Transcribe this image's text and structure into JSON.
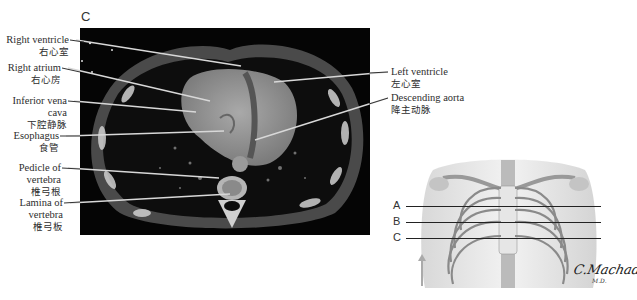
{
  "figure": {
    "panel_letter": "C",
    "ct_labels_left": [
      {
        "en": "Right ventricle",
        "zh": "右心室"
      },
      {
        "en": "Right atrium",
        "zh": "右心房"
      },
      {
        "en": "Inferior vena cava",
        "en_line1": "Inferior vena",
        "en_line2": "cava",
        "zh": "下腔静脉"
      },
      {
        "en": "Esophagus",
        "zh": "食管"
      },
      {
        "en": "Pedicle of vertebra",
        "en_line1": "Pedicle of",
        "en_line2": "vertebra",
        "zh": "椎弓根"
      },
      {
        "en": "Lamina of vertebra",
        "en_line1": "Lamina of",
        "en_line2": "vertebra",
        "zh": "椎弓板"
      }
    ],
    "ct_labels_right": [
      {
        "en": "Left ventricle",
        "zh": "左心室"
      },
      {
        "en": "Descending aorta",
        "zh": "降主动脉"
      }
    ],
    "section_levels": [
      "A",
      "B",
      "C"
    ],
    "signature": "C.Machado",
    "signature_sub": "M.D."
  }
}
